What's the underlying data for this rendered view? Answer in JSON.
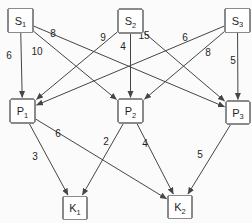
{
  "diagram": {
    "type": "layered-network",
    "width": 252,
    "height": 223,
    "colors": {
      "background": "#fbfbfb",
      "node_fill": "#ffffff",
      "node_border": "#8a8a8a",
      "edge": "#454545",
      "text": "#1f1f1f"
    },
    "layers": {
      "top": [
        "S1",
        "S2",
        "S3"
      ],
      "middle": [
        "P1",
        "P2",
        "P3"
      ],
      "bottom": [
        "K1",
        "K2"
      ]
    },
    "nodes": [
      {
        "id": "S1",
        "base": "S",
        "sub": "1",
        "cx": 20.5,
        "cy": 20.5,
        "w": 25,
        "h": 24
      },
      {
        "id": "S2",
        "base": "S",
        "sub": "2",
        "cx": 130.5,
        "cy": 21,
        "w": 25,
        "h": 24
      },
      {
        "id": "S3",
        "base": "S",
        "sub": "3",
        "cx": 237.5,
        "cy": 20.5,
        "w": 25,
        "h": 24
      },
      {
        "id": "P1",
        "base": "P",
        "sub": "1",
        "cx": 22.5,
        "cy": 111,
        "w": 25,
        "h": 24
      },
      {
        "id": "P2",
        "base": "P",
        "sub": "2",
        "cx": 130.5,
        "cy": 111,
        "w": 25,
        "h": 24
      },
      {
        "id": "P3",
        "base": "P",
        "sub": "3",
        "cx": 238,
        "cy": 112.5,
        "w": 24,
        "h": 23
      },
      {
        "id": "K1",
        "base": "K",
        "sub": "1",
        "cx": 75,
        "cy": 208,
        "w": 24,
        "h": 23
      },
      {
        "id": "K2",
        "base": "K",
        "sub": "2",
        "cx": 180,
        "cy": 207,
        "w": 24,
        "h": 23
      }
    ],
    "edges": [
      {
        "from": "S1",
        "to": "P1",
        "label": "6",
        "label_x": 9,
        "label_y": 55
      },
      {
        "from": "S1",
        "to": "P2",
        "label": "10",
        "label_x": 37,
        "label_y": 51
      },
      {
        "from": "S1",
        "to": "P3",
        "label": "8",
        "label_x": 53,
        "label_y": 33
      },
      {
        "from": "S2",
        "to": "P1",
        "label": "9",
        "label_x": 103,
        "label_y": 37
      },
      {
        "from": "S2",
        "to": "P2",
        "label": "4",
        "label_x": 123,
        "label_y": 46
      },
      {
        "from": "S2",
        "to": "P3",
        "label": "15",
        "label_x": 144,
        "label_y": 35
      },
      {
        "from": "S3",
        "to": "P1",
        "label": "6",
        "label_x": 185,
        "label_y": 37
      },
      {
        "from": "S3",
        "to": "P2",
        "label": "8",
        "label_x": 208,
        "label_y": 52
      },
      {
        "from": "S3",
        "to": "P3",
        "label": "5",
        "label_x": 233,
        "label_y": 60
      },
      {
        "from": "P1",
        "to": "K1",
        "label": "3",
        "label_x": 35,
        "label_y": 156
      },
      {
        "from": "P1",
        "to": "K2",
        "label": "6",
        "label_x": 58,
        "label_y": 133
      },
      {
        "from": "P2",
        "to": "K1",
        "label": "2",
        "label_x": 106,
        "label_y": 141
      },
      {
        "from": "P2",
        "to": "K2",
        "label": "4",
        "label_x": 145,
        "label_y": 143
      },
      {
        "from": "P3",
        "to": "K2",
        "label": "5",
        "label_x": 200,
        "label_y": 154
      }
    ]
  }
}
